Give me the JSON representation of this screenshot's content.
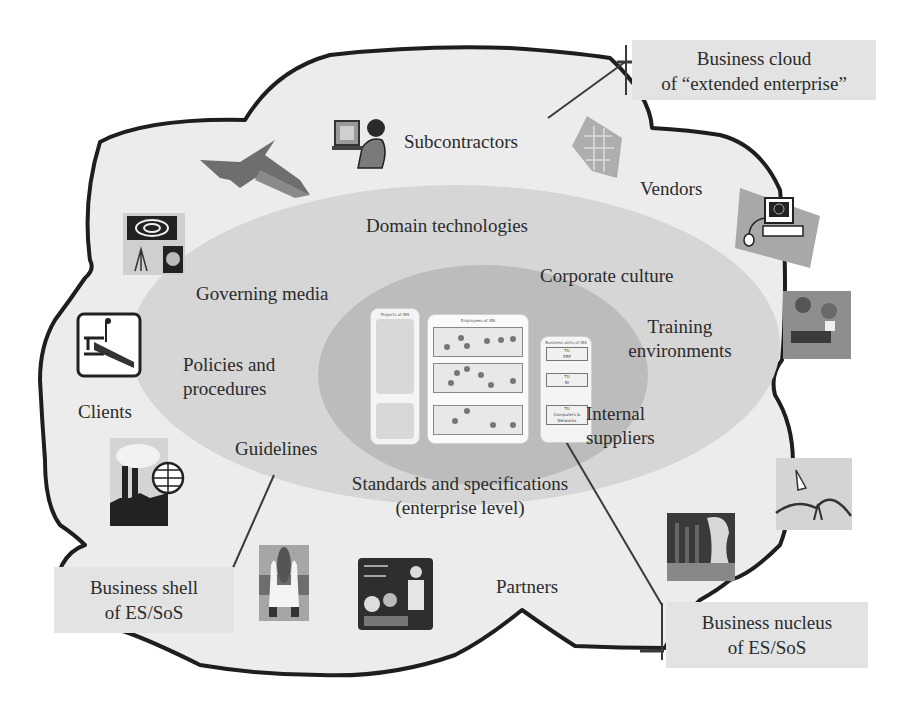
{
  "diagram": {
    "layers": {
      "cloud": {
        "callout": [
          "Business cloud",
          "of “extended enterprise”"
        ],
        "labels": {
          "subcontractors": "Subcontractors",
          "vendors": "Vendors",
          "clients": "Clients",
          "partners": "Partners"
        },
        "icons": [
          "fighter-jet-icon",
          "woman-at-computer-icon",
          "circuit-board-icon",
          "networked-computer-icon",
          "astronomy-icon",
          "steel-beam-crane-icon",
          "factory-globe-icon",
          "team-collage-icon",
          "graph-people-icon",
          "space-shuttle-icon",
          "classroom-teacher-icon",
          "bar-chart-people-icon"
        ]
      },
      "shell": {
        "callout": [
          "Business shell",
          "of ES/SoS"
        ],
        "labels": {
          "domain_technologies": "Domain technologies",
          "corporate_culture": "Corporate culture",
          "governing_media": "Governing media",
          "training_line1": "Training",
          "training_line2": "environments",
          "policies_line1": "Policies and",
          "policies_line2": "procedures",
          "internal_line1": "Internal",
          "internal_line2": "suppliers",
          "guidelines": "Guidelines",
          "standards_line1": "Standards and specifications",
          "standards_line2": "(enterprise level)"
        }
      },
      "nucleus": {
        "callout": [
          "Business nucleus",
          "of ES/SoS"
        ],
        "panels": {
          "projects": "Projects of IBS",
          "employees": "Employees of IBS",
          "units": "Business units of IBS"
        },
        "units": [
          {
            "line1": "TU",
            "line2": "ERP"
          },
          {
            "line1": "TU",
            "line2": "BI"
          },
          {
            "line1": "TU",
            "line2": "Computers &",
            "line3": "Networks"
          }
        ],
        "ellipsis": "..."
      }
    },
    "colors": {
      "cloud_fill": "#ececec",
      "shell_fill": "#d6d6d6",
      "nucleus_fill": "#bcbcbc",
      "outline": "#1e1e1e",
      "callout_bg": "#e3e3e3",
      "leader_line": "#3a3a3a"
    }
  }
}
